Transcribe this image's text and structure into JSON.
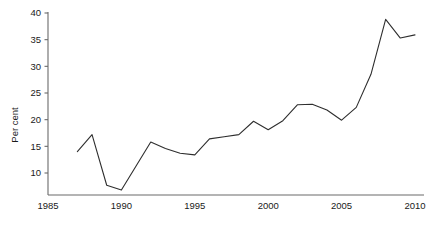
{
  "chart_data": {
    "type": "line",
    "title": "",
    "xlabel": "",
    "ylabel": "Per cent",
    "xlim": [
      1985,
      2010.5
    ],
    "ylim": [
      6.0,
      40
    ],
    "grid": false,
    "legend": false,
    "x_ticks": [
      "1985",
      "1990",
      "1995",
      "2000",
      "2005",
      "2010"
    ],
    "x_tick_values": [
      1985,
      1990,
      1995,
      2000,
      2005,
      2010
    ],
    "y_ticks": [
      "10",
      "15",
      "20",
      "25",
      "30",
      "35",
      "40"
    ],
    "y_tick_values": [
      10,
      15,
      20,
      25,
      30,
      35,
      40
    ],
    "series": [
      {
        "name": "Per cent",
        "color": "#2e2e2e",
        "x": [
          1987,
          1988,
          1989,
          1990,
          1991,
          1992,
          1993,
          1994,
          1995,
          1996,
          1997,
          1998,
          1999,
          2000,
          2001,
          2002,
          2003,
          2004,
          2005,
          2006,
          2007,
          2008,
          2009,
          2010
        ],
        "values": [
          14.0,
          17.2,
          7.7,
          6.8,
          11.3,
          15.8,
          14.6,
          13.7,
          13.4,
          16.4,
          16.8,
          17.2,
          19.7,
          18.1,
          19.8,
          22.8,
          22.9,
          21.8,
          19.9,
          22.3,
          28.5,
          38.8,
          35.3,
          35.9
        ]
      }
    ]
  },
  "axis": {
    "y_title": "Per cent"
  }
}
